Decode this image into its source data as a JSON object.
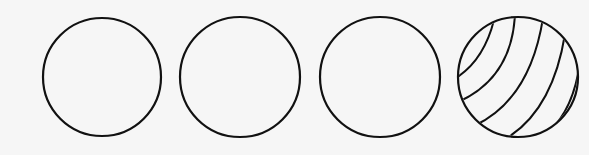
{
  "figure": {
    "background": "#f6f6f6",
    "stroke_color": "#111111",
    "shapes": [
      {
        "id": "circle-1",
        "type": "plain-circle",
        "cx": 102,
        "cy": 77,
        "r": 59
      },
      {
        "id": "circle-2",
        "type": "plain-circle",
        "cx": 240,
        "cy": 77,
        "r": 60
      },
      {
        "id": "circle-3",
        "type": "plain-circle",
        "cx": 380,
        "cy": 77,
        "r": 60
      },
      {
        "id": "circle-4",
        "type": "striped-ball",
        "cx": 518,
        "cy": 77,
        "r": 60,
        "stripe_count": 5
      }
    ]
  }
}
